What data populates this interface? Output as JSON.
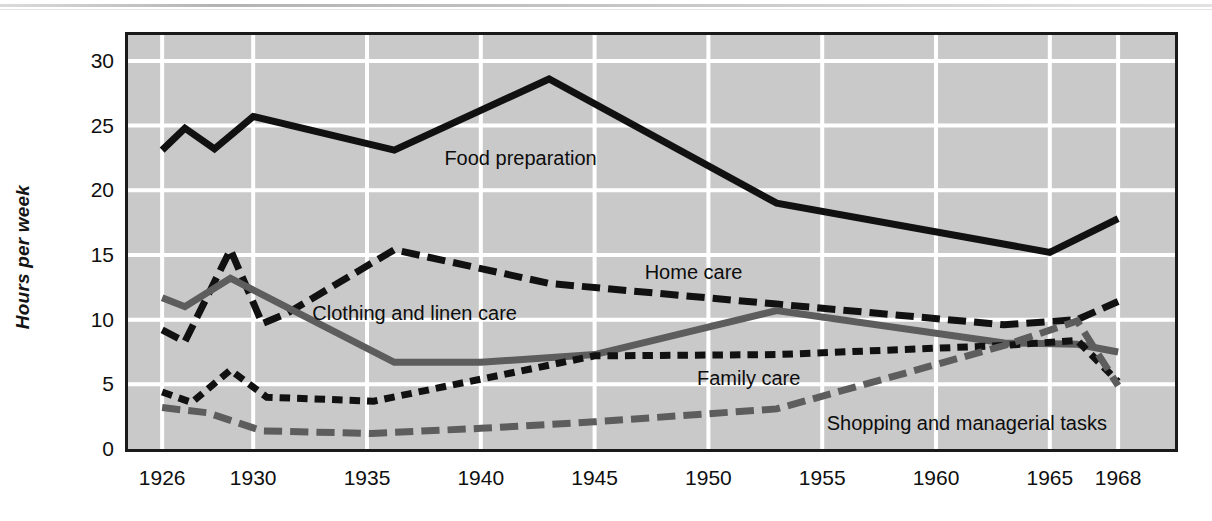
{
  "figure": {
    "background_color": "#ffffff",
    "plot_background_color": "#c9c9c9",
    "grid_color": "#ffffff",
    "frame_color": "#1a1a1a"
  },
  "chart_data": {
    "type": "line",
    "title": "",
    "subtitle": "",
    "xlabel": "",
    "ylabel": "Hours per week",
    "xlim": [
      1924.5,
      1970.5
    ],
    "ylim": [
      0,
      32
    ],
    "grid": true,
    "legend_position": "inline-annotations",
    "xticks": [
      1926,
      1930,
      1935,
      1940,
      1945,
      1950,
      1955,
      1960,
      1965,
      1968
    ],
    "xtick_labels": [
      "1926",
      "1930",
      "1935",
      "1940",
      "1945",
      "1950",
      "1955",
      "1960",
      "1965",
      "1968"
    ],
    "yticks": [
      0,
      5,
      10,
      15,
      20,
      25,
      30
    ],
    "ytick_labels": [
      "0",
      "5",
      "10",
      "15",
      "20",
      "25",
      "30"
    ],
    "series": [
      {
        "name": "Food preparation",
        "color": "#111111",
        "style": "solid",
        "width": 7,
        "label_x": 1938.4,
        "label_y": 22.4,
        "points": [
          [
            1926,
            23.1
          ],
          [
            1927,
            24.8
          ],
          [
            1928.3,
            23.2
          ],
          [
            1930,
            25.7
          ],
          [
            1936.2,
            23.1
          ],
          [
            1943,
            28.6
          ],
          [
            1953,
            19.0
          ],
          [
            1965,
            15.2
          ],
          [
            1968,
            17.8
          ]
        ]
      },
      {
        "name": "Home care",
        "color": "#111111",
        "style": "long-dash",
        "width": 7,
        "label_x": 1947.2,
        "label_y": 13.6,
        "points": [
          [
            1926,
            9.2
          ],
          [
            1927,
            8.3
          ],
          [
            1929,
            15.4
          ],
          [
            1930.4,
            9.7
          ],
          [
            1931.5,
            10.5
          ],
          [
            1936.2,
            15.4
          ],
          [
            1943,
            12.8
          ],
          [
            1953,
            11.2
          ],
          [
            1963,
            9.6
          ],
          [
            1966.2,
            10.0
          ],
          [
            1968,
            11.4
          ]
        ]
      },
      {
        "name": "Clothing and linen care",
        "color": "#5d5d5d",
        "style": "solid",
        "width": 7,
        "label_x": 1932.6,
        "label_y": 10.4,
        "points": [
          [
            1926,
            11.7
          ],
          [
            1927,
            11.0
          ],
          [
            1929,
            13.2
          ],
          [
            1936.2,
            6.7
          ],
          [
            1940,
            6.7
          ],
          [
            1945,
            7.3
          ],
          [
            1953,
            10.7
          ],
          [
            1963,
            8.2
          ],
          [
            1966.2,
            8.1
          ],
          [
            1968,
            7.5
          ]
        ]
      },
      {
        "name": "Family care",
        "color": "#111111",
        "style": "short-dash",
        "width": 7,
        "label_x": 1949.5,
        "label_y": 5.4,
        "points": [
          [
            1926,
            4.4
          ],
          [
            1927.3,
            3.6
          ],
          [
            1929,
            6.1
          ],
          [
            1930.6,
            4.0
          ],
          [
            1935.3,
            3.7
          ],
          [
            1940,
            5.4
          ],
          [
            1945,
            7.2
          ],
          [
            1953,
            7.3
          ],
          [
            1963,
            8.0
          ],
          [
            1966.2,
            8.4
          ],
          [
            1968,
            5.2
          ]
        ]
      },
      {
        "name": "Shopping and managerial tasks",
        "color": "#5d5d5d",
        "style": "long-dash",
        "width": 7,
        "label_x": 1955.2,
        "label_y": 1.9,
        "points": [
          [
            1926,
            3.2
          ],
          [
            1928,
            2.8
          ],
          [
            1930.4,
            1.4
          ],
          [
            1935.2,
            1.2
          ],
          [
            1940,
            1.6
          ],
          [
            1945,
            2.1
          ],
          [
            1953,
            3.1
          ],
          [
            1963,
            8.0
          ],
          [
            1966.2,
            9.9
          ],
          [
            1968,
            4.9
          ]
        ]
      }
    ]
  }
}
